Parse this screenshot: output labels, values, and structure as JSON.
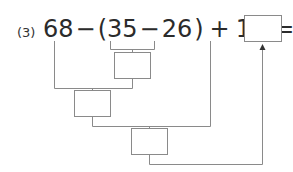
{
  "problem": {
    "number": "(3)",
    "expression": {
      "a": "68",
      "op1": "−",
      "lparen": "(",
      "b": "35",
      "op2": "−",
      "c": "26",
      "rparen": ")",
      "op3": "+",
      "d": "11",
      "eq": "="
    },
    "answer_box_value": "",
    "step_boxes": [
      "",
      "",
      ""
    ]
  },
  "colors": {
    "text": "#2b2b2b",
    "lines": "#8a8a8a"
  }
}
